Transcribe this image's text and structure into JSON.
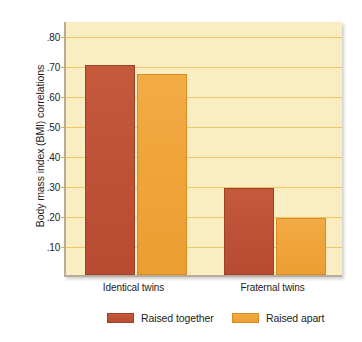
{
  "chart_data": {
    "type": "bar",
    "title": "",
    "xlabel": "",
    "ylabel": "Body mass index (BMI) correlations",
    "categories": [
      "Identical twins",
      "Fraternal twins"
    ],
    "series": [
      {
        "name": "Raised together",
        "color": "#bd5138",
        "values": [
          0.7,
          0.29
        ]
      },
      {
        "name": "Raised apart",
        "color": "#efa338",
        "values": [
          0.67,
          0.19
        ]
      }
    ],
    "ylim": [
      0,
      0.85
    ],
    "yticks": [
      0.1,
      0.2,
      0.3,
      0.4,
      0.5,
      0.6,
      0.7,
      0.8
    ],
    "ytick_labels": [
      ".10",
      ".20",
      ".30",
      ".40",
      ".50",
      ".60",
      ".70",
      ".80"
    ],
    "grid": true,
    "legend_position": "bottom",
    "plot_background": "#fbedc2",
    "gridline_color": "#e8b94e"
  },
  "axis": {
    "y_title": "Body mass index (BMI) correlations",
    "y_ticks": [
      {
        "label": ".80",
        "value": 0.8
      },
      {
        "label": ".70",
        "value": 0.7
      },
      {
        "label": ".60",
        "value": 0.6
      },
      {
        "label": ".50",
        "value": 0.5
      },
      {
        "label": ".40",
        "value": 0.4
      },
      {
        "label": ".30",
        "value": 0.3
      },
      {
        "label": ".20",
        "value": 0.2
      },
      {
        "label": ".10",
        "value": 0.1
      }
    ],
    "x_ticks": [
      {
        "label": "Identical twins"
      },
      {
        "label": "Fraternal twins"
      }
    ]
  },
  "legend": {
    "entries": [
      {
        "label": "Raised together",
        "color": "#bd5138"
      },
      {
        "label": "Raised apart",
        "color": "#efa338"
      }
    ]
  }
}
